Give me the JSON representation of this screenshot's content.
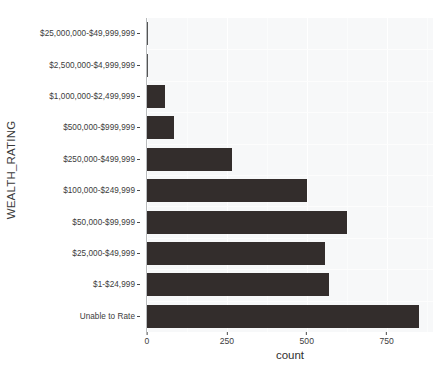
{
  "chart_data": {
    "type": "bar",
    "orientation": "horizontal",
    "title": "",
    "xlabel": "count",
    "ylabel": "WEALTH_RATING",
    "xlim": [
      0,
      895
    ],
    "xticks": [
      0,
      250,
      500,
      750
    ],
    "xtick_labels": [
      "0",
      "250",
      "500",
      "750"
    ],
    "grid": true,
    "legend": "none",
    "bar_color": "#332d2c",
    "panel_color": "#f7f8f9",
    "categories": [
      "$25,000,000-$49,999,999",
      "$2,500,000-$4,999,999",
      "$1,000,000-$2,499,999",
      "$500,000-$999,999",
      "$250,000-$499,999",
      "$100,000-$249,999",
      "$50,000-$99,999",
      "$25,000-$49,999",
      "$1-$24,999",
      "Unable to Rate"
    ],
    "values": [
      1,
      3,
      57,
      85,
      265,
      500,
      625,
      556,
      568,
      850
    ]
  },
  "axes": {
    "y_title": "WEALTH_RATING",
    "x_title": "count"
  }
}
